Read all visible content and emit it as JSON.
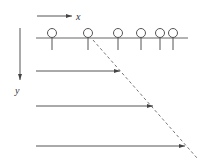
{
  "diagram": {
    "axis_x_label": "x",
    "axis_y_label": "y",
    "colors": {
      "line": "#555555",
      "dashed": "#777777",
      "background": "#ffffff"
    },
    "receivers_x": [
      52,
      88,
      118,
      141,
      160,
      173
    ],
    "ray_rows_y": [
      71,
      106,
      146
    ],
    "ray_tips_x": [
      120,
      153,
      185
    ]
  }
}
